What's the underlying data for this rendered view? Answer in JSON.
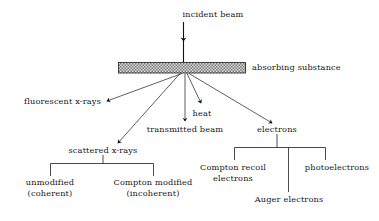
{
  "figure": {
    "type": "flow-diagram",
    "title_text": "interaction of an x-ray beam with an absorbing substance",
    "background_color": "#ffffff",
    "line_color": "#1a1a1a",
    "slab_fill_color": "#9a9a9a",
    "slab_border_color": "#2b2b2b"
  },
  "labels": {
    "incident_beam": "incident beam",
    "absorbing_substance": "absorbing substance",
    "fluorescent_xrays": "fluorescent x-rays",
    "heat": "heat",
    "transmitted_beam": "transmitted beam",
    "electrons": "electrons",
    "scattered_xrays": "scattered x-rays",
    "unmodified_line1": "unmodified",
    "unmodified_line2": "(coherent)",
    "compton_modified_line1": "Compton modified",
    "compton_modified_line2": "(incoherent)",
    "compton_recoil_line1": "Compton recoil",
    "compton_recoil_line2": "electrons",
    "auger_electrons": "Auger electrons",
    "photoelectrons": "photoelectrons"
  },
  "structure": {
    "input": "incident beam",
    "target": "absorbing substance",
    "outputs": [
      "fluorescent x-rays",
      "scattered x-rays",
      "transmitted beam",
      "heat",
      "electrons"
    ],
    "scattered_xrays_children": [
      "unmodified (coherent)",
      "Compton modified (incoherent)"
    ],
    "electrons_children": [
      "Compton recoil electrons",
      "Auger electrons",
      "photoelectrons"
    ]
  }
}
